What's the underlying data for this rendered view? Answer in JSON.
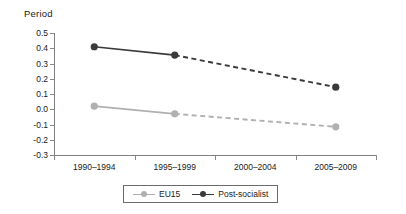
{
  "chart_data": {
    "type": "line",
    "title": "Period",
    "xlabel": "",
    "ylabel": "",
    "categories": [
      "1990–1994",
      "1995–1999",
      "2000–2004",
      "2005–2009"
    ],
    "ylim": [
      -0.3,
      0.5
    ],
    "ytick_labels": [
      "0.5",
      "0.4",
      "0.3",
      "0.2",
      "0.1",
      "0.0",
      "-0.1",
      "-0.2",
      "-0.3"
    ],
    "ytick_values": [
      0.5,
      0.4,
      0.3,
      0.2,
      0.1,
      0.0,
      -0.1,
      -0.2,
      -0.3
    ],
    "grid": false,
    "legend_position": "bottom",
    "series": [
      {
        "name": "EU15",
        "color": "#b0b0b0",
        "values": [
          0.02,
          -0.03,
          null,
          -0.115
        ],
        "segments": [
          {
            "from": 0,
            "to": 1,
            "style": "solid"
          },
          {
            "from": 1,
            "to": 3,
            "style": "dashed"
          }
        ]
      },
      {
        "name": "Post-socialist",
        "color": "#3a3a3a",
        "values": [
          0.41,
          0.355,
          null,
          0.145
        ],
        "segments": [
          {
            "from": 0,
            "to": 1,
            "style": "solid"
          },
          {
            "from": 1,
            "to": 3,
            "style": "dashed"
          }
        ]
      }
    ],
    "legend": [
      {
        "label": "EU15",
        "color": "#b0b0b0"
      },
      {
        "label": "Post-socialist",
        "color": "#3a3a3a"
      }
    ]
  }
}
